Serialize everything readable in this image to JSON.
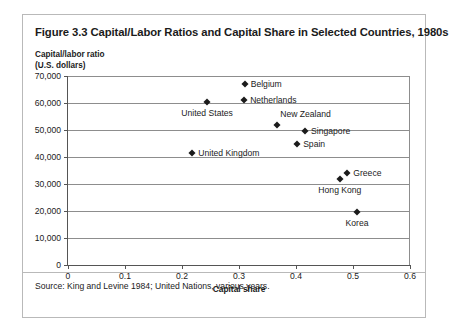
{
  "figure": {
    "title": "Figure 3.3 Capital/Labor Ratios and Capital Share in Selected Countries, 1980s",
    "source": "Source: King and Levine 1984; United Nations, various years."
  },
  "chart_data": {
    "type": "scatter",
    "title": "Figure 3.3 Capital/Labor Ratios and Capital Share in Selected Countries, 1980s",
    "xlabel": "Capital share",
    "ylabel": "Capital/labor ratio\n(U.S. dollars)",
    "ylabel_line1": "Capital/labor ratio",
    "ylabel_line2": "(U.S. dollars)",
    "xlim": [
      0,
      0.6
    ],
    "ylim": [
      0,
      70000
    ],
    "grid": "horizontal",
    "legend": "none",
    "xticks": [
      "0",
      "0.1",
      "0.2",
      "0.3",
      "0.4",
      "0.5",
      "0.6"
    ],
    "xtick_values": [
      0,
      0.1,
      0.2,
      0.3,
      0.4,
      0.5,
      0.6
    ],
    "yticks": [
      "0",
      "10,000",
      "20,000",
      "30,000",
      "40,000",
      "50,000",
      "60,000",
      "70,000"
    ],
    "ytick_values": [
      0,
      10000,
      20000,
      30000,
      40000,
      50000,
      60000,
      70000
    ],
    "marker": "diamond",
    "marker_color": "#1b1b1b",
    "points": [
      {
        "name": "Belgium",
        "x": 0.31,
        "y": 67000,
        "label_pos": "right"
      },
      {
        "name": "Netherlands",
        "x": 0.309,
        "y": 61000,
        "label_pos": "right"
      },
      {
        "name": "United States",
        "x": 0.244,
        "y": 60500,
        "label_pos": "below-center"
      },
      {
        "name": "New Zealand",
        "x": 0.367,
        "y": 52000,
        "label_pos": "above-right"
      },
      {
        "name": "Singapore",
        "x": 0.416,
        "y": 49500,
        "label_pos": "right"
      },
      {
        "name": "Spain",
        "x": 0.402,
        "y": 45000,
        "label_pos": "right"
      },
      {
        "name": "United Kingdom",
        "x": 0.218,
        "y": 41500,
        "label_pos": "right"
      },
      {
        "name": "Greece",
        "x": 0.49,
        "y": 34000,
        "label_pos": "right"
      },
      {
        "name": "Hong Kong",
        "x": 0.477,
        "y": 32000,
        "label_pos": "below-center"
      },
      {
        "name": "Korea",
        "x": 0.507,
        "y": 19500,
        "label_pos": "below-center"
      }
    ]
  }
}
